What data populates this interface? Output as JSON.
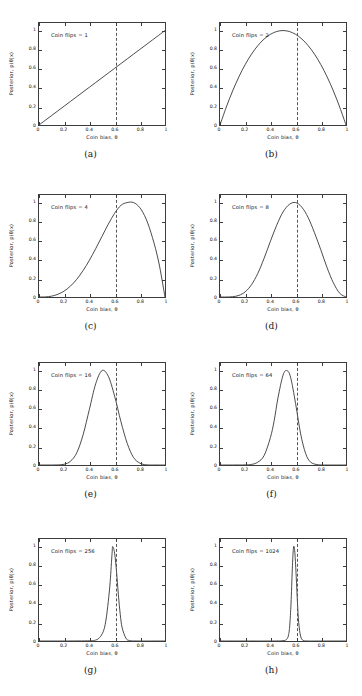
{
  "figure": {
    "rows": 4,
    "columns": 2,
    "background_color": "#ffffff",
    "axis_color": "#3c3c3c",
    "curve_color": "#2b2b2b",
    "refline_color": "#555555",
    "refline_style": "dashed"
  },
  "axes_common": {
    "xlabel": "Coin bias, θ",
    "ylabel": "Posterior, p(θ|x)",
    "xticks": [
      0,
      0.2,
      0.4,
      0.6,
      0.8,
      1
    ],
    "xticklabels": [
      "0",
      "0.2",
      "0.4",
      "0.6",
      "0.8",
      "1"
    ],
    "yticks": [
      0,
      0.2,
      0.4,
      0.6,
      0.8,
      1
    ],
    "yticklabels": [
      "0",
      "0.2",
      "0.4",
      "0.6",
      "0.8",
      "1"
    ],
    "xlim": [
      0,
      1
    ],
    "ylim": [
      0,
      1.08
    ],
    "true_bias_line": 0.6,
    "grid": false,
    "legend": null
  },
  "chart_data": [
    {
      "id": "a",
      "type": "line",
      "caption": "(a)",
      "title": "",
      "annotation": "Coin flips = 1",
      "coin_flips": 1,
      "xlabel": "Coin bias, θ",
      "ylabel": "Posterior, p(θ|x)",
      "xlim": [
        0,
        1
      ],
      "ylim": [
        0,
        1.08
      ],
      "xticklabels": [
        "0",
        "0.2",
        "0.4",
        "0.6",
        "0.8",
        "1"
      ],
      "yticklabels": [
        "0",
        "0.2",
        "0.4",
        "0.6",
        "0.8",
        "1"
      ],
      "vline_x": 0.6,
      "peak_x": 1.0,
      "peak_y": 1.0,
      "beta_a": 2,
      "beta_b": 1,
      "x": [
        0,
        0.05,
        0.1,
        0.15,
        0.2,
        0.25,
        0.3,
        0.35,
        0.4,
        0.45,
        0.5,
        0.55,
        0.6,
        0.65,
        0.7,
        0.75,
        0.8,
        0.85,
        0.9,
        0.95,
        1
      ],
      "y": [
        0,
        0.05,
        0.1,
        0.15,
        0.2,
        0.25,
        0.3,
        0.35,
        0.4,
        0.45,
        0.5,
        0.55,
        0.6,
        0.65,
        0.7,
        0.75,
        0.8,
        0.85,
        0.9,
        0.95,
        1
      ]
    },
    {
      "id": "b",
      "type": "line",
      "caption": "(b)",
      "title": "",
      "annotation": "Coin flips = 2",
      "coin_flips": 2,
      "xlabel": "Coin bias, θ",
      "ylabel": "Posterior, p(θ|x)",
      "xlim": [
        0,
        1
      ],
      "ylim": [
        0,
        1.08
      ],
      "xticklabels": [
        "0",
        "0.2",
        "0.4",
        "0.6",
        "0.8",
        "1"
      ],
      "yticklabels": [
        "0",
        "0.2",
        "0.4",
        "0.6",
        "0.8",
        "1"
      ],
      "vline_x": 0.6,
      "peak_x": 0.5,
      "peak_y": 1.0,
      "beta_a": 2,
      "beta_b": 2,
      "x": [
        0,
        0.05,
        0.1,
        0.15,
        0.2,
        0.25,
        0.3,
        0.35,
        0.4,
        0.45,
        0.5,
        0.55,
        0.6,
        0.65,
        0.7,
        0.75,
        0.8,
        0.85,
        0.9,
        0.95,
        1
      ],
      "y": [
        0,
        0.19,
        0.36,
        0.51,
        0.64,
        0.75,
        0.84,
        0.91,
        0.96,
        0.99,
        1.0,
        0.99,
        0.96,
        0.91,
        0.84,
        0.75,
        0.64,
        0.51,
        0.36,
        0.19,
        0
      ]
    },
    {
      "id": "c",
      "type": "line",
      "caption": "(c)",
      "title": "",
      "annotation": "Coin flips = 4",
      "coin_flips": 4,
      "xlabel": "Coin bias, θ",
      "ylabel": "Posterior, p(θ|x)",
      "xlim": [
        0,
        1
      ],
      "ylim": [
        0,
        1.08
      ],
      "xticklabels": [
        "0",
        "0.2",
        "0.4",
        "0.6",
        "0.8",
        "1"
      ],
      "yticklabels": [
        "0",
        "0.2",
        "0.4",
        "0.6",
        "0.8",
        "1"
      ],
      "vline_x": 0.6,
      "peak_x": 0.75,
      "peak_y": 1.0,
      "beta_a": 4,
      "beta_b": 2,
      "x": [
        0,
        0.05,
        0.1,
        0.15,
        0.2,
        0.25,
        0.3,
        0.35,
        0.4,
        0.45,
        0.5,
        0.55,
        0.6,
        0.65,
        0.7,
        0.75,
        0.8,
        0.85,
        0.9,
        0.95,
        1
      ],
      "y": [
        0,
        0.001,
        0.009,
        0.029,
        0.063,
        0.116,
        0.188,
        0.28,
        0.389,
        0.512,
        0.642,
        0.771,
        0.886,
        0.97,
        1.0,
        1.0,
        0.946,
        0.826,
        0.631,
        0.371,
        0
      ]
    },
    {
      "id": "d",
      "type": "line",
      "caption": "(d)",
      "title": "",
      "annotation": "Coin flips = 8",
      "coin_flips": 8,
      "xlabel": "Coin bias, θ",
      "ylabel": "Posterior, p(θ|x)",
      "xlim": [
        0,
        1
      ],
      "ylim": [
        0,
        1.08
      ],
      "xticklabels": [
        "0",
        "0.2",
        "0.4",
        "0.6",
        "0.8",
        "1"
      ],
      "yticklabels": [
        "0",
        "0.2",
        "0.4",
        "0.6",
        "0.8",
        "1"
      ],
      "vline_x": 0.6,
      "peak_x": 0.5,
      "peak_y": 1.0,
      "beta_a": 5,
      "beta_b": 5,
      "x": [
        0,
        0.05,
        0.1,
        0.15,
        0.2,
        0.25,
        0.3,
        0.35,
        0.4,
        0.45,
        0.5,
        0.55,
        0.6,
        0.65,
        0.7,
        0.75,
        0.8,
        0.85,
        0.9,
        0.95,
        1
      ],
      "y": [
        0,
        0.0,
        0.003,
        0.017,
        0.055,
        0.13,
        0.25,
        0.41,
        0.59,
        0.76,
        0.9,
        0.98,
        1.0,
        0.95,
        0.84,
        0.68,
        0.5,
        0.31,
        0.15,
        0.04,
        0
      ]
    },
    {
      "id": "e",
      "type": "line",
      "caption": "(e)",
      "title": "",
      "annotation": "Coin flips = 16",
      "coin_flips": 16,
      "xlabel": "Coin bias, θ",
      "ylabel": "Posterior, p(θ|x)",
      "xlim": [
        0,
        1
      ],
      "ylim": [
        0,
        1.08
      ],
      "xticklabels": [
        "0",
        "0.2",
        "0.4",
        "0.6",
        "0.8",
        "1"
      ],
      "yticklabels": [
        "0",
        "0.2",
        "0.4",
        "0.6",
        "0.8",
        "1"
      ],
      "vline_x": 0.6,
      "peak_x": 0.5,
      "peak_y": 1.0,
      "beta_a": 9,
      "beta_b": 9,
      "x": [
        0,
        0.05,
        0.1,
        0.15,
        0.2,
        0.25,
        0.3,
        0.35,
        0.4,
        0.45,
        0.5,
        0.55,
        0.6,
        0.65,
        0.7,
        0.75,
        0.8,
        0.85,
        0.9,
        0.95,
        1
      ],
      "y": [
        0,
        0,
        0,
        0.001,
        0.008,
        0.04,
        0.13,
        0.32,
        0.59,
        0.86,
        1.0,
        0.94,
        0.73,
        0.46,
        0.23,
        0.08,
        0.02,
        0.002,
        0,
        0,
        0
      ]
    },
    {
      "id": "f",
      "type": "line",
      "caption": "(f)",
      "title": "",
      "annotation": "Coin flips = 64",
      "coin_flips": 64,
      "xlabel": "Coin bias, θ",
      "ylabel": "Posterior, p(θ|x)",
      "xlim": [
        0,
        1
      ],
      "ylim": [
        0,
        1.08
      ],
      "xticklabels": [
        "0",
        "0.2",
        "0.4",
        "0.6",
        "0.8",
        "1"
      ],
      "yticklabels": [
        "0",
        "0.2",
        "0.4",
        "0.6",
        "0.8",
        "1"
      ],
      "vline_x": 0.6,
      "peak_x": 0.53,
      "peak_y": 1.0,
      "beta_a": 35,
      "beta_b": 31,
      "x": [
        0,
        0.1,
        0.2,
        0.25,
        0.3,
        0.35,
        0.4,
        0.43,
        0.46,
        0.5,
        0.53,
        0.56,
        0.6,
        0.64,
        0.68,
        0.72,
        0.78,
        0.85,
        0.9,
        1
      ],
      "y": [
        0,
        0,
        0.001,
        0.006,
        0.03,
        0.1,
        0.29,
        0.47,
        0.71,
        0.95,
        1.0,
        0.93,
        0.65,
        0.33,
        0.12,
        0.03,
        0.002,
        0,
        0,
        0
      ]
    },
    {
      "id": "g",
      "type": "line",
      "caption": "(g)",
      "title": "",
      "annotation": "Coin flips = 256",
      "coin_flips": 256,
      "xlabel": "Coin bias, θ",
      "ylabel": "Posterior, p(θ|x)",
      "xlim": [
        0,
        1
      ],
      "ylim": [
        0,
        1.08
      ],
      "xticklabels": [
        "0",
        "0.2",
        "0.4",
        "0.6",
        "0.8",
        "1"
      ],
      "yticklabels": [
        "0",
        "0.2",
        "0.4",
        "0.6",
        "0.8",
        "1"
      ],
      "vline_x": 0.6,
      "peak_x": 0.585,
      "peak_y": 1.0,
      "beta_a": 150,
      "beta_b": 108,
      "x": [
        0,
        0.2,
        0.4,
        0.45,
        0.48,
        0.51,
        0.53,
        0.55,
        0.565,
        0.58,
        0.585,
        0.6,
        0.615,
        0.63,
        0.645,
        0.66,
        0.69,
        0.72,
        0.8,
        1
      ],
      "y": [
        0,
        0,
        0.002,
        0.01,
        0.035,
        0.1,
        0.21,
        0.42,
        0.63,
        0.93,
        1.0,
        0.93,
        0.74,
        0.49,
        0.28,
        0.14,
        0.03,
        0.005,
        0,
        0
      ]
    },
    {
      "id": "h",
      "type": "line",
      "caption": "(h)",
      "title": "",
      "annotation": "Coin flips = 1024",
      "coin_flips": 1024,
      "xlabel": "Coin bias, θ",
      "ylabel": "Posterior, p(θ|x)",
      "xlim": [
        0,
        1
      ],
      "ylim": [
        0,
        1.08
      ],
      "xticklabels": [
        "0",
        "0.2",
        "0.4",
        "0.6",
        "0.8",
        "1"
      ],
      "yticklabels": [
        "0",
        "0.2",
        "0.4",
        "0.6",
        "0.8",
        "1"
      ],
      "vline_x": 0.6,
      "peak_x": 0.585,
      "peak_y": 1.0,
      "beta_a": 600,
      "beta_b": 426,
      "x": [
        0,
        0.2,
        0.4,
        0.5,
        0.53,
        0.545,
        0.555,
        0.565,
        0.575,
        0.582,
        0.588,
        0.595,
        0.605,
        0.615,
        0.625,
        0.64,
        0.66,
        0.7,
        0.8,
        1
      ],
      "y": [
        0,
        0,
        0,
        0.003,
        0.02,
        0.07,
        0.19,
        0.44,
        0.8,
        0.97,
        1.0,
        0.92,
        0.68,
        0.4,
        0.19,
        0.05,
        0.006,
        0,
        0,
        0
      ]
    }
  ]
}
